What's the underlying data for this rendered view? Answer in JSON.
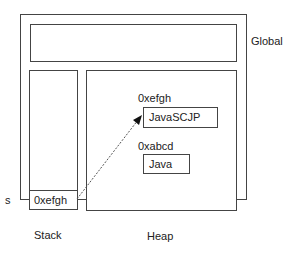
{
  "diagram": {
    "regions": {
      "global": {
        "label": "Global"
      },
      "stack": {
        "label": "Stack"
      },
      "heap": {
        "label": "Heap"
      }
    },
    "stack_variable": {
      "name": "s",
      "value": "0xefgh"
    },
    "heap_objects": [
      {
        "address": "0xefgh",
        "value": "JavaSCJP"
      },
      {
        "address": "0xabcd",
        "value": "Java"
      }
    ],
    "reference": {
      "from": "s",
      "to": "0xefgh"
    }
  }
}
